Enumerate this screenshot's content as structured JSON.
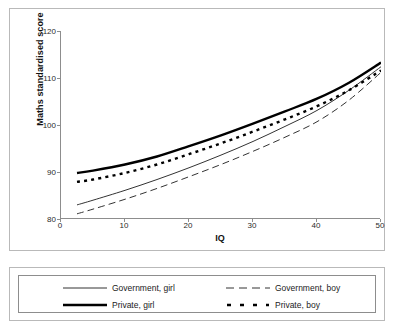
{
  "chart_data": {
    "type": "line",
    "title": "",
    "xlabel": "IQ",
    "ylabel": "Maths standardised score",
    "xlim": [
      0,
      50
    ],
    "ylim": [
      80,
      120
    ],
    "xticks": [
      0,
      10,
      20,
      30,
      40,
      50
    ],
    "yticks": [
      80,
      90,
      100,
      110,
      120
    ],
    "grid": false,
    "legend_position": "below-plot",
    "x": [
      2.5,
      5,
      10,
      15,
      20,
      25,
      30,
      35,
      40,
      45,
      50
    ],
    "series": [
      {
        "name": "Government, girl",
        "style": "thin-solid",
        "color": "#333333",
        "values": [
          83.0,
          84.0,
          86.1,
          88.4,
          90.9,
          93.6,
          96.5,
          99.7,
          103.1,
          107.4,
          112.4
        ]
      },
      {
        "name": "Government, boy",
        "style": "thin-dashed",
        "color": "#333333",
        "values": [
          81.1,
          82.1,
          84.2,
          86.5,
          89.0,
          91.6,
          94.4,
          97.4,
          100.7,
          105.3,
          111.2
        ]
      },
      {
        "name": "Private, girl",
        "style": "thick-solid",
        "color": "#000000",
        "values": [
          89.8,
          90.3,
          91.6,
          93.3,
          95.5,
          97.8,
          100.3,
          102.9,
          105.6,
          109.0,
          113.3
        ]
      },
      {
        "name": "Private, boy",
        "style": "thick-dotted",
        "color": "#000000",
        "values": [
          87.9,
          88.4,
          89.8,
          91.6,
          93.8,
          96.1,
          98.6,
          101.2,
          104.0,
          107.4,
          111.6
        ]
      }
    ],
    "legend_entries": [
      {
        "label": "Government, girl",
        "style": "thin-solid"
      },
      {
        "label": "Government, boy",
        "style": "thin-dashed"
      },
      {
        "label": "Private, girl",
        "style": "thick-solid"
      },
      {
        "label": "Private, boy",
        "style": "thick-dotted"
      }
    ]
  },
  "axes": {
    "y_title": "Maths standardised score",
    "x_title": "IQ",
    "y_tick_labels": [
      "120",
      "110",
      "100",
      "90",
      "80"
    ],
    "x_tick_labels": [
      "0",
      "10",
      "20",
      "30",
      "40",
      "50"
    ]
  },
  "legend": {
    "items": [
      {
        "label": "Government, girl"
      },
      {
        "label": "Government, boy"
      },
      {
        "label": "Private, girl"
      },
      {
        "label": "Private, boy"
      }
    ]
  },
  "colors": {
    "frame": "#b9b9b9",
    "axis": "#8d8d8d",
    "line_thin": "#333333",
    "line_thick": "#000000",
    "text": "#1b1b1b",
    "background": "#ffffff"
  }
}
